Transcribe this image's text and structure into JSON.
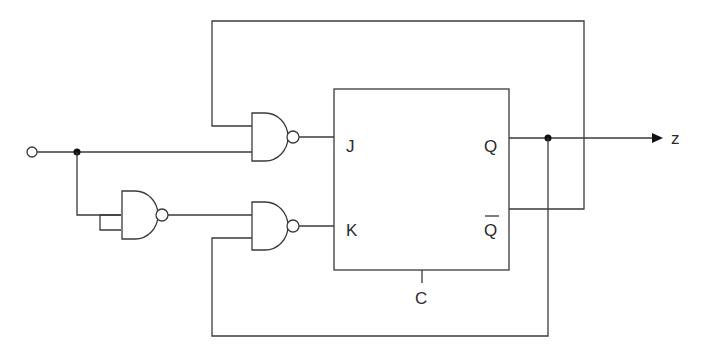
{
  "diagram": {
    "type": "sequential-logic-circuit",
    "flipflop": {
      "type": "JK",
      "inputs": {
        "j": "J",
        "k": "K",
        "clock": "C"
      },
      "outputs": {
        "q": "Q",
        "qbar": "Q"
      }
    },
    "output_label": "z",
    "gates": [
      {
        "id": "nand-j",
        "type": "NAND"
      },
      {
        "id": "nand-inverter",
        "type": "NAND"
      },
      {
        "id": "nand-k",
        "type": "NAND"
      }
    ],
    "colors": {
      "line": "#3a3a3a",
      "background": "#ffffff"
    }
  }
}
